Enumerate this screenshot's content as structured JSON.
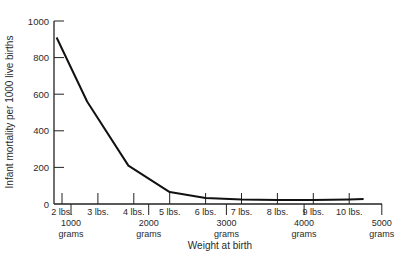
{
  "chart_data": {
    "type": "line",
    "title": "",
    "xlabel": "Weight at birth",
    "ylabel": "Infant mortality per 1000 live births",
    "ylim": [
      0,
      1000
    ],
    "y_ticks": [
      0,
      200,
      400,
      600,
      800,
      1000
    ],
    "y_tick_labels": [
      "0",
      "200",
      "400",
      "600",
      "800",
      "1000"
    ],
    "x_primary_unit": "lbs",
    "x_ticks_lbs": [
      2,
      3,
      4,
      5,
      6,
      7,
      8,
      9,
      10
    ],
    "x_tick_labels_lbs": [
      "2 lbs.",
      "3 lbs.",
      "4 lbs.",
      "5 lbs.",
      "6 lbs.",
      "7 lbs.",
      "8 lbs.",
      "9 lbs.",
      "10 lbs."
    ],
    "x_secondary_unit": "grams",
    "x_ticks_grams": [
      1000,
      2000,
      3000,
      4000,
      5000
    ],
    "x_tick_labels_grams": [
      "1000",
      "2000",
      "3000",
      "4000",
      "5000"
    ],
    "x_tick_sublabel_grams": "grams",
    "grid": false,
    "legend": null,
    "series": [
      {
        "name": "Infant mortality",
        "x_lbs": [
          1.85,
          2.7,
          3.85,
          5.0,
          6.0,
          7.0,
          8.0,
          9.0,
          10.0,
          10.4
        ],
        "values": [
          910,
          560,
          210,
          65,
          33,
          25,
          22,
          22,
          25,
          27
        ]
      }
    ]
  }
}
